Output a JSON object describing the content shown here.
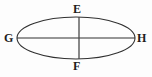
{
  "figure": {
    "type": "geometry-diagram",
    "shape": "ellipse",
    "background_color": "#fdfdfd",
    "stroke_color": "#303030",
    "label_color": "#1d1d1d",
    "ellipse": {
      "center_x": 76,
      "center_y": 38,
      "semi_major_axis": 59,
      "semi_minor_axis": 21,
      "stroke_width": 1.1
    },
    "axes": [
      {
        "name": "major-axis",
        "orientation": "horizontal",
        "endpoint_labels": [
          "G",
          "H"
        ],
        "x1": 17,
        "y1": 38,
        "x2": 135,
        "y2": 38,
        "stroke_width": 1.1
      },
      {
        "name": "minor-axis",
        "orientation": "vertical",
        "endpoint_labels": [
          "E",
          "F"
        ],
        "x1": 79,
        "y1": 17,
        "x2": 79,
        "y2": 59,
        "stroke_width": 1.3
      }
    ],
    "labels": {
      "left": "G",
      "right": "H",
      "top": "E",
      "bottom": "F"
    }
  }
}
